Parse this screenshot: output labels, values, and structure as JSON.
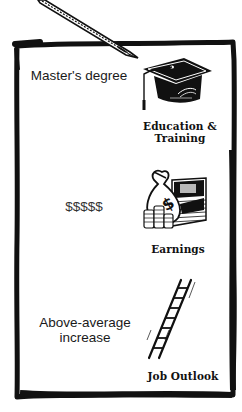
{
  "card": {
    "rows": [
      {
        "category": "Education & Training",
        "category_line1": "Education &",
        "category_line2": "Training",
        "value": "Master's degree",
        "icon": "graduation-cap-icon"
      },
      {
        "category": "Earnings",
        "value": "$$$$$",
        "icon": "money-bag-icon"
      },
      {
        "category": "Job Outlook",
        "value_line1": "Above-average",
        "value_line2": "increase",
        "icon": "ladder-icon"
      }
    ]
  },
  "colors": {
    "ink": "#111111",
    "background": "#ffffff",
    "text": "#1a1a1a"
  }
}
